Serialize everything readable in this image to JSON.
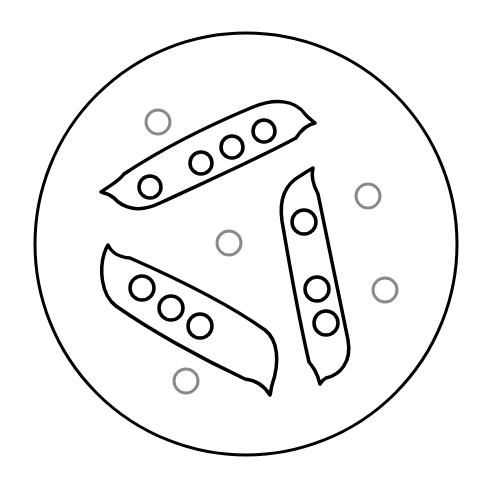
{
  "illustration": {
    "title": "Pea pods in a petri dish",
    "canvas": {
      "width": 493,
      "height": 485,
      "background": "#ffffff"
    },
    "dish": {
      "cx": 246,
      "cy": 244,
      "r": 211,
      "stroke": "#000000",
      "stroke_width": 3
    },
    "pods": [
      {
        "name": "pod-top",
        "peas": 4
      },
      {
        "name": "pod-right",
        "peas": 3
      },
      {
        "name": "pod-left",
        "peas": 3
      }
    ],
    "pod_stroke": "#000000",
    "pea_stroke": "#000000",
    "loose_pea_color": "#8a8a8a",
    "loose_peas": [
      {
        "cx": 158,
        "cy": 122
      },
      {
        "cx": 229,
        "cy": 243
      },
      {
        "cx": 368,
        "cy": 196
      },
      {
        "cx": 385,
        "cy": 290
      },
      {
        "cx": 186,
        "cy": 381
      }
    ]
  }
}
